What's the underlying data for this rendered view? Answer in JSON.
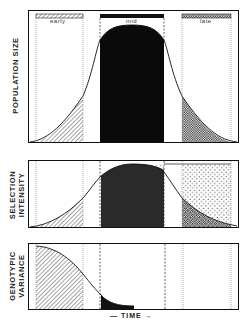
{
  "figure": {
    "panels": [
      {
        "id": "population-size",
        "ylabel": "POPULATION SIZE"
      },
      {
        "id": "selection-intensity",
        "ylabel_line1": "SELECTION",
        "ylabel_line2": "INTENSITY"
      },
      {
        "id": "genotypic-variance",
        "ylabel_line1": "GENOTYPIC",
        "ylabel_line2": "VARIANCE"
      }
    ],
    "zones": [
      {
        "label": "early",
        "pattern": "diagonal-hatch"
      },
      {
        "label": "mid",
        "pattern": "solid-black"
      },
      {
        "label": "late",
        "pattern": "crosshatch"
      }
    ],
    "xlabel": "— TIME →",
    "colors": {
      "ink": "#111111",
      "background": "#ffffff",
      "mid_fill": "#0a0a0a",
      "mid_fill_selection": "#2a2a2a"
    }
  }
}
